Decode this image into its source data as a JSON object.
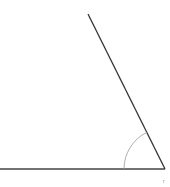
{
  "diagram": {
    "type": "angle",
    "vertex": [
      165,
      169
    ],
    "base_ray_end": [
      0,
      169
    ],
    "slant_ray_end": [
      88,
      14
    ],
    "arc_radius": 41,
    "line_color": "#333333",
    "arc_color": "#999999",
    "corner_label": "r"
  }
}
